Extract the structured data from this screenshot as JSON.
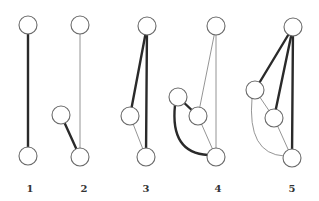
{
  "diagram": {
    "node_radius": 9,
    "graphs": [
      {
        "label": "1",
        "label_pos": [
          30,
          192
        ],
        "nodes": [
          [
            28,
            25
          ],
          [
            28,
            156
          ]
        ],
        "edges": [
          {
            "from": 0,
            "to": 1,
            "weight": "thick"
          }
        ]
      },
      {
        "label": "2",
        "label_pos": [
          84,
          192
        ],
        "nodes": [
          [
            80,
            25
          ],
          [
            61,
            115
          ],
          [
            80,
            157
          ]
        ],
        "edges": [
          {
            "from": 0,
            "to": 2,
            "weight": "thin"
          },
          {
            "from": 1,
            "to": 2,
            "weight": "thick"
          }
        ]
      },
      {
        "label": "3",
        "label_pos": [
          146,
          192
        ],
        "nodes": [
          [
            147,
            26
          ],
          [
            130,
            116
          ],
          [
            146,
            157
          ]
        ],
        "edges": [
          {
            "from": 0,
            "to": 1,
            "weight": "thick"
          },
          {
            "from": 0,
            "to": 2,
            "weight": "thick"
          },
          {
            "from": 1,
            "to": 2,
            "weight": "thin"
          }
        ]
      },
      {
        "label": "4",
        "label_pos": [
          218,
          192
        ],
        "nodes": [
          [
            216,
            26
          ],
          [
            178,
            97
          ],
          [
            198,
            116
          ],
          [
            216,
            157
          ]
        ],
        "edges": [
          {
            "from": 0,
            "to": 2,
            "weight": "thin"
          },
          {
            "from": 0,
            "to": 3,
            "weight": "thin"
          },
          {
            "from": 1,
            "to": 2,
            "weight": "thick"
          },
          {
            "from": 2,
            "to": 3,
            "weight": "thin"
          },
          {
            "from": 1,
            "to": 3,
            "weight": "thick",
            "curved": true
          }
        ]
      },
      {
        "label": "5",
        "label_pos": [
          292,
          192
        ],
        "nodes": [
          [
            293,
            27
          ],
          [
            255,
            90
          ],
          [
            274,
            118
          ],
          [
            292,
            158
          ]
        ],
        "edges": [
          {
            "from": 0,
            "to": 1,
            "weight": "thick"
          },
          {
            "from": 0,
            "to": 2,
            "weight": "thick"
          },
          {
            "from": 0,
            "to": 3,
            "weight": "thick"
          },
          {
            "from": 1,
            "to": 2,
            "weight": "thin"
          },
          {
            "from": 2,
            "to": 3,
            "weight": "thin"
          },
          {
            "from": 1,
            "to": 3,
            "weight": "thin",
            "curved": true
          }
        ]
      }
    ]
  }
}
